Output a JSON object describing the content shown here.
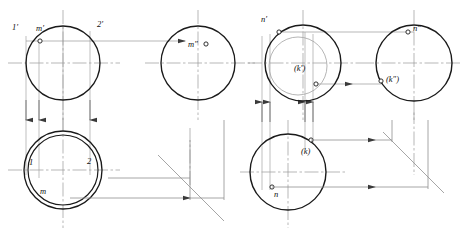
{
  "figure": {
    "type": "engineering-projection-drawing",
    "panels": 2,
    "stroke_colors": {
      "object_outline": "#1a1a1a",
      "thin_line": "#8a8a8a",
      "center_line": "#9a9a9a",
      "projection_line": "#9a9a9a",
      "miter_line": "#8a8a8a"
    }
  },
  "left_panel": {
    "name": "cylinder-point-m",
    "front_view": {
      "center": {
        "x": 63,
        "y": 63
      },
      "radius": 37,
      "labels": [
        {
          "id": "label-1-prime",
          "text": "1′",
          "x": 14,
          "y": 27
        },
        {
          "id": "label-m-prime",
          "text": "m′",
          "x": 40,
          "y": 27
        },
        {
          "id": "label-2-prime",
          "text": "2′",
          "x": 99,
          "y": 24
        }
      ],
      "points": [
        {
          "id": "point-m-prime",
          "x": 40,
          "y": 41
        }
      ]
    },
    "side_view": {
      "center": {
        "x": 198,
        "y": 63
      },
      "radius": 37,
      "labels": [
        {
          "id": "label-m-double-prime",
          "text": "m″",
          "x": 186,
          "y": 43
        }
      ],
      "points": [
        {
          "id": "point-m-double-prime",
          "x": 206,
          "y": 44
        }
      ]
    },
    "top_view": {
      "center": {
        "x": 63,
        "y": 170
      },
      "radius_outer": 39,
      "radius_inner": 35,
      "labels": [
        {
          "id": "label-1",
          "text": "1",
          "x": 30,
          "y": 162
        },
        {
          "id": "label-2",
          "text": "2",
          "x": 88,
          "y": 161
        },
        {
          "id": "label-m",
          "text": "m",
          "x": 41,
          "y": 190
        }
      ]
    },
    "miter_line": {
      "x1": 158,
      "y1": 155,
      "x2": 224,
      "y2": 221
    }
  },
  "right_panel": {
    "name": "sphere-points-n-k",
    "front_view": {
      "center": {
        "x": 303,
        "y": 63
      },
      "radius": 38,
      "inner_circle": {
        "cx": 298,
        "cy": 66,
        "r": 29
      },
      "labels": [
        {
          "id": "label-n-prime",
          "text": "n′",
          "x": 262,
          "y": 19
        },
        {
          "id": "label-k-prime",
          "text": "(k′)",
          "x": 296,
          "y": 68
        }
      ],
      "points": [
        {
          "id": "point-n-prime",
          "x": 279,
          "y": 32
        },
        {
          "id": "point-k-prime",
          "x": 316,
          "y": 84
        }
      ]
    },
    "side_view": {
      "center": {
        "x": 414,
        "y": 63
      },
      "radius": 38,
      "labels": [
        {
          "id": "label-n-double-prime",
          "text": "n″",
          "x": 414,
          "y": 27
        },
        {
          "id": "label-k-double-prime",
          "text": "(k″)",
          "x": 388,
          "y": 78
        }
      ],
      "points": [
        {
          "id": "point-n-double-prime",
          "x": 408,
          "y": 32
        },
        {
          "id": "point-k-double-prime",
          "x": 381,
          "y": 81
        }
      ]
    },
    "top_view": {
      "center": {
        "x": 288,
        "y": 172
      },
      "radius": 38,
      "labels": [
        {
          "id": "label-k",
          "text": "(k)",
          "x": 303,
          "y": 151
        },
        {
          "id": "label-n",
          "text": "n",
          "x": 277,
          "y": 197
        }
      ],
      "points": [
        {
          "id": "point-k",
          "x": 311,
          "y": 140
        },
        {
          "id": "point-n",
          "x": 272,
          "y": 187
        }
      ]
    },
    "miter_line": {
      "x1": 383,
      "y1": 132,
      "x2": 444,
      "y2": 193
    }
  }
}
